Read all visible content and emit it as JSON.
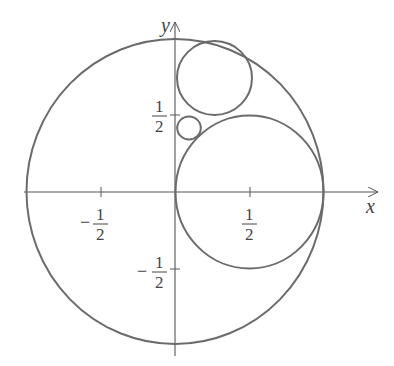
{
  "diagram": {
    "title": "",
    "axes": {
      "x_label": "x",
      "y_label": "y",
      "x_ticks": [
        {
          "value": -0.5,
          "numerator": "1",
          "denominator": "2",
          "sign": "−"
        },
        {
          "value": 0.5,
          "numerator": "1",
          "denominator": "2",
          "sign": ""
        }
      ],
      "y_ticks": [
        {
          "value": 0.5,
          "numerator": "1",
          "denominator": "2",
          "sign": ""
        },
        {
          "value": -0.5,
          "numerator": "1",
          "denominator": "2",
          "sign": "−"
        }
      ]
    },
    "circles": [
      {
        "name": "outer-circle",
        "cx": 0,
        "cy": 0,
        "r": 1
      },
      {
        "name": "large-circle",
        "cx": 0.5,
        "cy": 0,
        "r": 0.5
      },
      {
        "name": "upper-circle",
        "cx": 0.25,
        "cy": 0.707,
        "r": 0.25
      },
      {
        "name": "small-circle",
        "cx": 0.093,
        "cy": 0.418,
        "r": 0.077
      }
    ],
    "colors": {
      "stroke": "#6b6b6b",
      "axis": "#555555",
      "text": "#444444"
    }
  }
}
